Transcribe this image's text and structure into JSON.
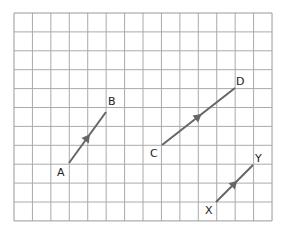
{
  "grid": {
    "left": 14,
    "top": 13,
    "cell_w": 18.43,
    "cell_h": 18.9,
    "cols": 14,
    "rows": 11,
    "line_color": "#aaaaaa",
    "border_color": "#999999"
  },
  "vector_color": "#666666",
  "vectors": [
    {
      "id": "AB",
      "start": {
        "label": "A",
        "x": 69,
        "y": 163,
        "lx": 57,
        "ly": 176
      },
      "end": {
        "label": "B",
        "x": 106,
        "y": 112,
        "lx": 108,
        "ly": 105
      }
    },
    {
      "id": "CD",
      "start": {
        "label": "C",
        "x": 162,
        "y": 145,
        "lx": 150,
        "ly": 157
      },
      "end": {
        "label": "D",
        "x": 235,
        "y": 88,
        "lx": 236,
        "ly": 85
      }
    },
    {
      "id": "XY",
      "start": {
        "label": "X",
        "x": 216,
        "y": 202,
        "lx": 205,
        "ly": 214
      },
      "end": {
        "label": "Y",
        "x": 253,
        "y": 165,
        "lx": 255,
        "ly": 162
      }
    }
  ]
}
